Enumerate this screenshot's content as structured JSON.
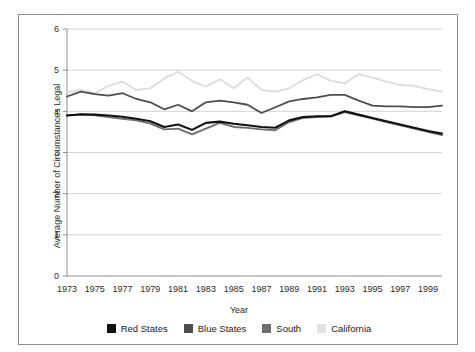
{
  "figure": {
    "title_partial": "",
    "frame_color": "#8d8d8d",
    "background": "#ffffff"
  },
  "chart_data": {
    "type": "line",
    "title": "",
    "xlabel": "Year",
    "ylabel": "Average Number of Circumstances Legal",
    "xlim": [
      1973,
      2000
    ],
    "ylim": [
      0,
      6
    ],
    "yticks": [
      0,
      1,
      2,
      3,
      4,
      5,
      6
    ],
    "grid": "horizontal",
    "legend_position": "bottom",
    "x": [
      1973,
      1974,
      1975,
      1976,
      1977,
      1978,
      1979,
      1980,
      1981,
      1982,
      1983,
      1984,
      1985,
      1986,
      1987,
      1988,
      1989,
      1990,
      1991,
      1992,
      1993,
      1994,
      1995,
      1996,
      1997,
      1998,
      1999,
      2000
    ],
    "xtick_labels": [
      "1973",
      "1975",
      "1977",
      "1979",
      "1981",
      "1983",
      "1985",
      "1987",
      "1989",
      "1991",
      "1993",
      "1995",
      "1997",
      "1999"
    ],
    "series": [
      {
        "name": "Red States",
        "color": "#111111",
        "values": [
          3.9,
          3.93,
          3.92,
          3.9,
          3.87,
          3.82,
          3.76,
          3.62,
          3.68,
          3.55,
          3.72,
          3.75,
          3.7,
          3.66,
          3.62,
          3.6,
          3.78,
          3.86,
          3.88,
          3.88,
          4.0,
          3.92,
          3.84,
          3.76,
          3.68,
          3.6,
          3.52,
          3.46
        ]
      },
      {
        "name": "Blue States",
        "color": "#4d4d4d",
        "values": [
          4.36,
          4.48,
          4.42,
          4.38,
          4.44,
          4.3,
          4.22,
          4.05,
          4.16,
          4.0,
          4.22,
          4.26,
          4.22,
          4.16,
          3.96,
          4.1,
          4.24,
          4.3,
          4.34,
          4.4,
          4.4,
          4.26,
          4.14,
          4.12,
          4.12,
          4.1,
          4.1,
          4.14
        ]
      },
      {
        "name": "South",
        "color": "#6e6e6e",
        "values": [
          3.9,
          3.92,
          3.9,
          3.86,
          3.82,
          3.78,
          3.7,
          3.56,
          3.58,
          3.44,
          3.58,
          3.72,
          3.62,
          3.6,
          3.56,
          3.54,
          3.74,
          3.84,
          3.86,
          3.88,
          3.98,
          3.9,
          3.82,
          3.74,
          3.66,
          3.58,
          3.5,
          3.42
        ]
      },
      {
        "name": "California",
        "color": "#dcdcdc",
        "values": [
          4.46,
          4.52,
          4.44,
          4.62,
          4.72,
          4.52,
          4.56,
          4.8,
          4.96,
          4.74,
          4.6,
          4.78,
          4.56,
          4.82,
          4.52,
          4.48,
          4.56,
          4.76,
          4.9,
          4.74,
          4.68,
          4.9,
          4.82,
          4.72,
          4.64,
          4.62,
          4.54,
          4.48
        ]
      }
    ]
  },
  "legend": {
    "items": [
      {
        "label": "Red States",
        "color": "#111111"
      },
      {
        "label": "Blue States",
        "color": "#4d4d4d"
      },
      {
        "label": "South",
        "color": "#6e6e6e"
      },
      {
        "label": "California",
        "color": "#e2e2e2"
      }
    ]
  }
}
